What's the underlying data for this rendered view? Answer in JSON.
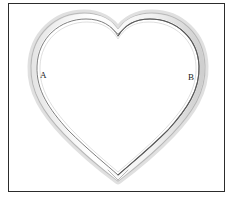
{
  "figure": {
    "frame": {
      "border_color": "#2c2c2c",
      "background_color": "#ffffff",
      "x": 8,
      "y": 3,
      "width": 217,
      "height": 189
    },
    "shape": {
      "name": "heart-shaped-loop",
      "description": "Closed heart-shaped band drawn as a double outline with shading",
      "stroke_dark_color": "#4a4a4a",
      "stroke_light_color": "#c8c8c8",
      "band_fill_color": "#fcfcfc",
      "shadow_color": "#dcdcdc",
      "top_cleft_x": 118,
      "top_cleft_y": 30,
      "bottom_point_x": 118,
      "bottom_point_y": 180,
      "left_extent_x": 30,
      "right_extent_x": 206
    },
    "labels": [
      {
        "id": "A",
        "text": "A",
        "x": 40,
        "y": 71,
        "color": "#1a1a1a"
      },
      {
        "id": "B",
        "text": "B",
        "x": 188,
        "y": 73,
        "color": "#1a1a1a"
      }
    ]
  }
}
